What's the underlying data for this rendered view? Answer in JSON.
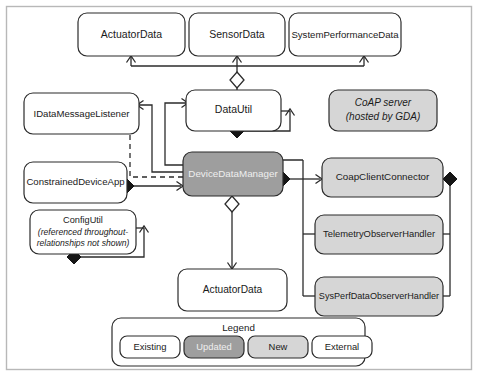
{
  "diagram": {
    "frame": {
      "color": "#b8b8b8"
    },
    "palette": {
      "existing_fill": "#ffffff",
      "updated_fill": "#9e9e9e",
      "new_fill": "#d6d6d6",
      "external_fill": "#ffffff",
      "stroke": "#2b2b2b",
      "text": "#1a1a1a",
      "text_on_updated": "#efefef"
    },
    "nodes": [
      {
        "id": "actuator-data-top",
        "label": "ActuatorData",
        "style": "existing"
      },
      {
        "id": "sensor-data",
        "label": "SensorData",
        "style": "existing"
      },
      {
        "id": "system-performance-data",
        "label": "SystemPerformanceData",
        "style": "existing"
      },
      {
        "id": "idata-message-listener",
        "label": "IDataMessageListener",
        "style": "existing"
      },
      {
        "id": "data-util",
        "label": "DataUtil",
        "style": "existing"
      },
      {
        "id": "coap-server",
        "label": "CoAP server",
        "label2": "(hosted by GDA)",
        "style": "new"
      },
      {
        "id": "constrained-device-app",
        "label": "ConstrainedDeviceApp",
        "style": "existing"
      },
      {
        "id": "device-data-manager",
        "label": "DeviceDataManager",
        "style": "updated"
      },
      {
        "id": "coap-client-connector",
        "label": "CoapClientConnector",
        "style": "new"
      },
      {
        "id": "config-util",
        "label": "ConfigUtil",
        "label2": "(referenced throughout-",
        "label3": "relationships not shown)",
        "style": "existing"
      },
      {
        "id": "telemetry-observer-handler",
        "label": "TelemetryObserverHandler",
        "style": "new"
      },
      {
        "id": "actuator-data-bottom",
        "label": "ActuatorData",
        "style": "existing"
      },
      {
        "id": "sysperf-observer-handler",
        "label": "SysPerfDataObserverHandler",
        "style": "new"
      }
    ],
    "legend": {
      "title": "Legend",
      "items": [
        {
          "id": "legend-existing",
          "label": "Existing",
          "style": "existing"
        },
        {
          "id": "legend-updated",
          "label": "Updated",
          "style": "updated"
        },
        {
          "id": "legend-new",
          "label": "New",
          "style": "new"
        },
        {
          "id": "legend-external",
          "label": "External",
          "style": "external"
        }
      ]
    },
    "relationships": [
      {
        "from": "data-util",
        "to": "actuator-data-top",
        "type": "association"
      },
      {
        "from": "data-util",
        "to": "sensor-data",
        "type": "association"
      },
      {
        "from": "data-util",
        "to": "system-performance-data",
        "type": "association"
      },
      {
        "from": "device-data-manager",
        "to": "data-util",
        "type": "aggregation"
      },
      {
        "from": "data-util",
        "to": "data-util",
        "type": "composition"
      },
      {
        "from": "device-data-manager",
        "to": "idata-message-listener",
        "type": "realization"
      },
      {
        "from": "constrained-device-app",
        "to": "device-data-manager",
        "type": "composition"
      },
      {
        "from": "device-data-manager",
        "to": "coap-client-connector",
        "type": "composition"
      },
      {
        "from": "device-data-manager",
        "to": "actuator-data-bottom",
        "type": "aggregation"
      },
      {
        "from": "config-util",
        "to": "config-util",
        "type": "composition"
      },
      {
        "from": "coap-client-connector",
        "to": "telemetry-observer-handler",
        "type": "composition"
      },
      {
        "from": "coap-client-connector",
        "to": "sysperf-observer-handler",
        "type": "composition"
      },
      {
        "from": "device-data-manager",
        "to": "idata-message-listener",
        "type": "association"
      },
      {
        "from": "device-data-manager",
        "to": "data-util",
        "type": "association"
      }
    ]
  }
}
